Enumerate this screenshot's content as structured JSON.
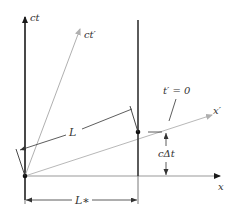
{
  "diagram": {
    "labels": {
      "ct_axis": "ct",
      "ct_prime_axis": "ct′",
      "x_axis": "x",
      "x_prime_axis": "x′",
      "t_prime_zero": "t′ = 0",
      "length_L": "L",
      "length_L_star": "L∗",
      "c_delta_t": "cΔt"
    },
    "colors": {
      "axis": "#1a1a1a",
      "primed_axis": "#b0b0b0",
      "dimension": "#333333"
    }
  }
}
